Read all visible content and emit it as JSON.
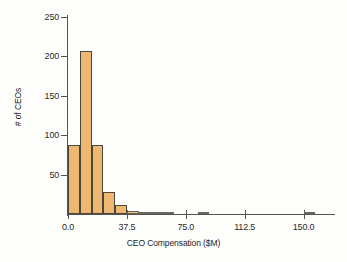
{
  "chart_data": {
    "type": "bar",
    "title": "",
    "xlabel": "CEO Compensation ($M)",
    "ylabel": "# of CEOs",
    "xlim": [
      0,
      168.75
    ],
    "ylim": [
      0,
      250
    ],
    "grid": false,
    "legend": null,
    "bin_width": 7.5,
    "x_ticks": [
      "0.0",
      "37.5",
      "75.0",
      "112.5",
      "150.0"
    ],
    "x_tick_values": [
      0,
      37.5,
      75,
      112.5,
      150
    ],
    "y_ticks": [
      "50",
      "100",
      "150",
      "200",
      "250"
    ],
    "y_tick_values": [
      50,
      100,
      150,
      200,
      250
    ],
    "categories": [
      0,
      7.5,
      15,
      22.5,
      30,
      37.5,
      45,
      52.5,
      60,
      67.5,
      75,
      82.5,
      90,
      97.5,
      105,
      112.5,
      120,
      127.5,
      135,
      142.5,
      150,
      157.5
    ],
    "values": [
      88,
      207,
      88,
      28,
      11,
      4,
      2,
      2,
      3,
      0,
      0,
      2,
      0,
      0,
      0,
      0,
      0,
      0,
      0,
      0,
      3,
      0
    ],
    "bar_color": "#efb871",
    "bar_edge_color": "#4a4640",
    "axis_color": "#55544f",
    "text_color": "#23231f"
  }
}
